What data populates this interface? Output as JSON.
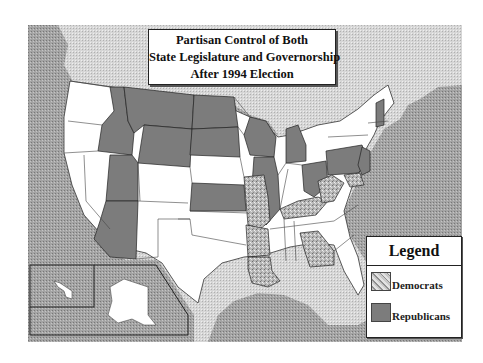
{
  "title": {
    "line1": "Partisan Control of Both",
    "line2": "State Legislature and Governorship",
    "line3": "After 1994 Election"
  },
  "legend": {
    "heading": "Legend",
    "items": [
      {
        "label": "Democrats",
        "pattern": "stippled"
      },
      {
        "label": "Republicans",
        "pattern": "solid"
      }
    ]
  },
  "colors": {
    "ocean": "#9a9a9a",
    "foreign_land": "#cfcfcf",
    "split_control": "#ffffff",
    "democrats": "#b4b4b4",
    "republicans": "#7c7c7c",
    "border": "#333333"
  },
  "states": {
    "republicans": [
      "Idaho",
      "Montana",
      "Wyoming",
      "North Dakota",
      "South Dakota",
      "Utah",
      "Arizona",
      "Kansas",
      "Wisconsin",
      "Michigan",
      "Illinois",
      "Ohio",
      "Pennsylvania",
      "New Jersey",
      "New Hampshire"
    ],
    "democrats": [
      "Missouri",
      "Arkansas",
      "Louisiana",
      "Kentucky",
      "West Virginia",
      "Maryland",
      "Georgia"
    ]
  }
}
